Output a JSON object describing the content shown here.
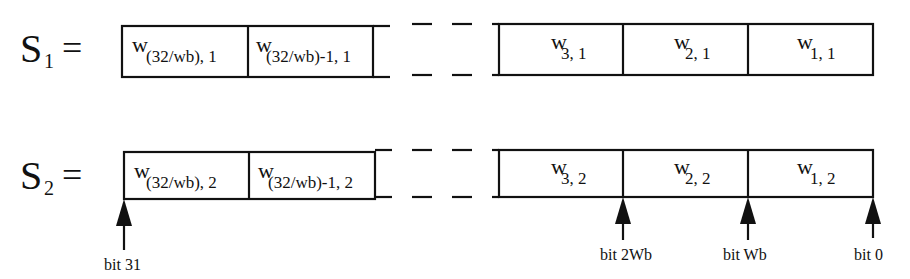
{
  "rows": [
    {
      "label_main": "S",
      "label_sub": "1",
      "equals": "=",
      "left_cells": [
        {
          "base": "w",
          "sub": "(32/wb), 1"
        },
        {
          "base": "w",
          "sub": "(32/wb)-1, 1"
        }
      ],
      "right_cells": [
        {
          "base": "w",
          "sub": "3, 1"
        },
        {
          "base": "w",
          "sub": "2, 1"
        },
        {
          "base": "w",
          "sub": "1, 1"
        }
      ]
    },
    {
      "label_main": "S",
      "label_sub": "2",
      "equals": "=",
      "left_cells": [
        {
          "base": "w",
          "sub": "(32/wb), 2"
        },
        {
          "base": "w",
          "sub": "(32/wb)-1, 2"
        }
      ],
      "right_cells": [
        {
          "base": "w",
          "sub": "3, 2"
        },
        {
          "base": "w",
          "sub": "2, 2"
        },
        {
          "base": "w",
          "sub": "1, 2"
        }
      ]
    }
  ],
  "bit_markers": [
    {
      "label": "bit 31",
      "x": 124
    },
    {
      "label": "bit 2Wb",
      "x": 623
    },
    {
      "label": "bit Wb",
      "x": 748
    },
    {
      "label": "bit 0",
      "x": 873
    }
  ],
  "colors": {
    "stroke": "#111111",
    "background": "#ffffff"
  }
}
